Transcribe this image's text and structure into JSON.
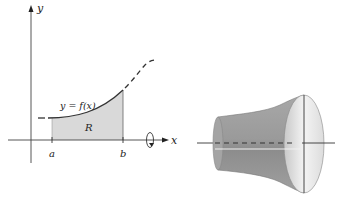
{
  "left_figure": {
    "axis_labels": {
      "x": "x",
      "y": "y"
    },
    "curve_label": "y = f(x)",
    "region_label": "R",
    "tick_labels": {
      "a": "a",
      "b": "b"
    },
    "rotation_icon": "rotation-arrow-icon"
  },
  "right_figure": {
    "description": "solid of revolution formed by rotating R about the x-axis"
  },
  "colors": {
    "region_fill": "#d9d9d9",
    "solid_dark": "#8f8f8f",
    "solid_light": "#e6e6e6",
    "stroke": "#333333"
  }
}
